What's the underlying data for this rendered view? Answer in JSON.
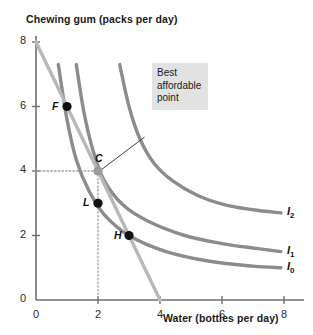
{
  "chart_data": {
    "type": "line",
    "title": "",
    "xlabel": "Water (bottles per day)",
    "ylabel": "Chewing gum (packs per day)",
    "xlim": [
      0,
      8
    ],
    "ylim": [
      0,
      8
    ],
    "xticks": [
      "0",
      "2",
      "4",
      "6",
      "8"
    ],
    "yticks": [
      "0",
      "2",
      "4",
      "6",
      "8"
    ],
    "grid": false,
    "legend_position": "right-inline",
    "series": [
      {
        "name": "I0",
        "label": "I",
        "sub": "0",
        "kind": "indifference-curve",
        "color": "#8c8c8c",
        "points": [
          [
            0.72,
            7.3
          ],
          [
            1.0,
            5.6
          ],
          [
            1.3,
            4.35
          ],
          [
            1.7,
            3.4
          ],
          [
            2.2,
            2.65
          ],
          [
            3.0,
            2.0
          ],
          [
            4.2,
            1.5
          ],
          [
            5.6,
            1.2
          ],
          [
            7.0,
            1.05
          ],
          [
            7.9,
            1.0
          ]
        ]
      },
      {
        "name": "I1",
        "label": "I",
        "sub": "1",
        "kind": "indifference-curve",
        "color": "#8c8c8c",
        "points": [
          [
            1.3,
            7.3
          ],
          [
            1.55,
            5.8
          ],
          [
            1.85,
            4.6
          ],
          [
            2.2,
            3.7
          ],
          [
            2.8,
            2.95
          ],
          [
            3.6,
            2.45
          ],
          [
            4.8,
            2.0
          ],
          [
            6.0,
            1.75
          ],
          [
            7.1,
            1.6
          ],
          [
            7.9,
            1.5
          ]
        ]
      },
      {
        "name": "I2",
        "label": "I",
        "sub": "2",
        "kind": "indifference-curve",
        "color": "#8c8c8c",
        "points": [
          [
            2.7,
            7.3
          ],
          [
            3.0,
            6.0
          ],
          [
            3.35,
            5.0
          ],
          [
            3.8,
            4.25
          ],
          [
            4.4,
            3.7
          ],
          [
            5.2,
            3.25
          ],
          [
            6.1,
            2.95
          ],
          [
            7.0,
            2.8
          ],
          [
            7.9,
            2.7
          ]
        ]
      },
      {
        "name": "budget-line",
        "label": "",
        "sub": "",
        "kind": "budget-line",
        "color": "#b8b8b8",
        "points": [
          [
            0,
            8
          ],
          [
            4,
            0
          ]
        ]
      }
    ],
    "points": [
      {
        "name": "F",
        "label": "F",
        "x": 1,
        "y": 6,
        "fill": "#111111",
        "label_side": "left"
      },
      {
        "name": "C",
        "label": "C",
        "x": 2,
        "y": 4,
        "fill": "#9a9a9a",
        "label_side": "top"
      },
      {
        "name": "L",
        "label": "L",
        "x": 2,
        "y": 3,
        "fill": "#111111",
        "label_side": "left"
      },
      {
        "name": "H",
        "label": "H",
        "x": 3,
        "y": 2,
        "fill": "#111111",
        "label_side": "left"
      }
    ],
    "guides": [
      {
        "name": "horizontal-guide-y4",
        "from": [
          0,
          4
        ],
        "to": [
          2,
          4
        ],
        "style": "dotted"
      },
      {
        "name": "vertical-guide-x2",
        "from": [
          2,
          4
        ],
        "to": [
          2,
          0
        ],
        "style": "dotted"
      }
    ],
    "annotations": [
      {
        "name": "best-affordable-point",
        "lines": [
          "Best",
          "affordable",
          "point"
        ],
        "leader_from": [
          3.5,
          5.05
        ],
        "leader_to": [
          2.12,
          4.05
        ]
      }
    ]
  }
}
